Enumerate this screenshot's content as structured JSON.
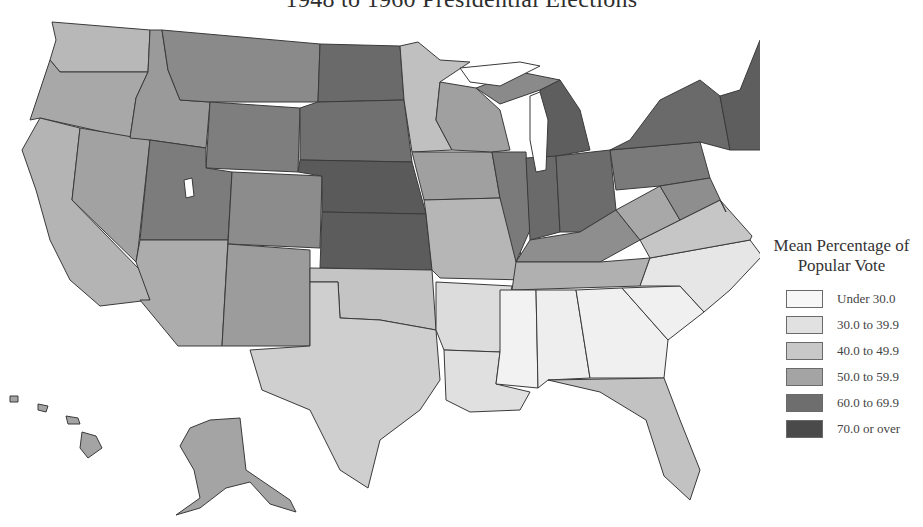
{
  "title": "1948 to 1960 Presidential Elections",
  "legend": {
    "title_line1": "Mean Percentage of",
    "title_line2": "Popular Vote",
    "items": [
      {
        "label": "Under 30.0",
        "color": "#f7f7f7"
      },
      {
        "label": "30.0 to 39.9",
        "color": "#e1e1e1"
      },
      {
        "label": "40.0 to 49.9",
        "color": "#c8c8c8"
      },
      {
        "label": "50.0 to 59.9",
        "color": "#a4a4a4"
      },
      {
        "label": "60.0 to 69.9",
        "color": "#6e6e6e"
      },
      {
        "label": "70.0 or over",
        "color": "#4a4a4a"
      }
    ]
  },
  "colors": {
    "c0": "#f7f7f7",
    "c1": "#e1e1e1",
    "c2": "#c8c8c8",
    "c3": "#a4a4a4",
    "c4": "#6e6e6e",
    "c5": "#4a4a4a",
    "border": "#3a3a3a"
  }
}
